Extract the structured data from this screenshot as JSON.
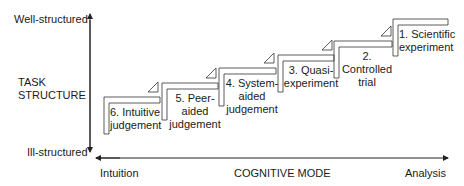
{
  "y_axis": {
    "title_line1": "TASK",
    "title_line2": "STRUCTURE",
    "top_label": "Well-structured",
    "bottom_label": "Ill-structured"
  },
  "x_axis": {
    "title": "COGNITIVE MODE",
    "left_label": "Intuition",
    "right_label": "Analysis"
  },
  "steps": [
    {
      "number": "1.",
      "line1": "1. Scientific",
      "line2": "experiment",
      "line3": ""
    },
    {
      "number": "2.",
      "line1": "2.",
      "line2": "Controlled",
      "line3": "trial"
    },
    {
      "number": "3.",
      "line1": "3. Quasi-",
      "line2": "experiment",
      "line3": ""
    },
    {
      "number": "4.",
      "line1": "4. System-",
      "line2": "aided",
      "line3": "judgement"
    },
    {
      "number": "5.",
      "line1": "5. Peer-",
      "line2": "aided",
      "line3": "judgement"
    },
    {
      "number": "6.",
      "line1": "6. Intuitive",
      "line2": "judgement",
      "line3": ""
    }
  ],
  "colors": {
    "line": "#222222",
    "text": "#1a1a1a",
    "background": "#ffffff"
  }
}
